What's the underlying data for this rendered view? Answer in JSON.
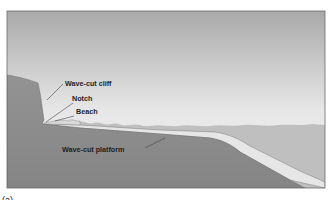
{
  "figure": {
    "caption": "(a)",
    "labels": {
      "cliff": "Wave-cut cliff",
      "notch": "Notch",
      "beach": "Beach",
      "platform": "Wave-cut platform"
    }
  },
  "colors": {
    "sky_top": "#adadad",
    "sky_bottom": "#f3f3f3",
    "land": "#8d8d8d",
    "water": "#bdbdbd",
    "platform": "#e4e4e4",
    "frame": "#6a6a6a"
  }
}
